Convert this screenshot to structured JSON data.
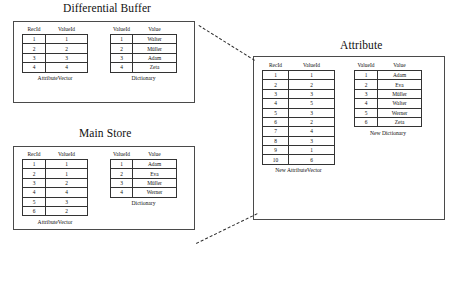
{
  "diagram": {
    "groups": [
      {
        "key": "differential_buffer",
        "title": "Differential Buffer",
        "tables": [
          {
            "key": "db_attribute_vector",
            "caption": "AttributeVector",
            "headers": [
              "RecId",
              "ValueId"
            ],
            "rows": [
              [
                "1",
                "1"
              ],
              [
                "2",
                "2"
              ],
              [
                "3",
                "3"
              ],
              [
                "4",
                "4"
              ]
            ]
          },
          {
            "key": "db_dictionary",
            "caption": "Dictionary",
            "headers": [
              "ValueId",
              "Value"
            ],
            "rows": [
              [
                "1",
                "Walter"
              ],
              [
                "2",
                "Müller"
              ],
              [
                "3",
                "Adam"
              ],
              [
                "4",
                "Zeta"
              ]
            ]
          }
        ]
      },
      {
        "key": "main_store",
        "title": "Main Store",
        "tables": [
          {
            "key": "ms_attribute_vector",
            "caption": "AttributeVector",
            "headers": [
              "RecId",
              "ValueId"
            ],
            "rows": [
              [
                "1",
                "1"
              ],
              [
                "2",
                "1"
              ],
              [
                "3",
                "2"
              ],
              [
                "4",
                "4"
              ],
              [
                "5",
                "3"
              ],
              [
                "6",
                "2"
              ]
            ]
          },
          {
            "key": "ms_dictionary",
            "caption": "Dictionary",
            "headers": [
              "ValueId",
              "Value"
            ],
            "rows": [
              [
                "1",
                "Adam"
              ],
              [
                "2",
                "Eva"
              ],
              [
                "3",
                "Müller"
              ],
              [
                "4",
                "Werner"
              ]
            ]
          }
        ]
      },
      {
        "key": "attribute",
        "title": "Attribute",
        "tables": [
          {
            "key": "new_attribute_vector",
            "caption": "New AttributeVector",
            "headers": [
              "RecId",
              "ValueId"
            ],
            "rows": [
              [
                "1",
                "1"
              ],
              [
                "2",
                "2"
              ],
              [
                "3",
                "3"
              ],
              [
                "4",
                "5"
              ],
              [
                "5",
                "3"
              ],
              [
                "6",
                "2"
              ],
              [
                "7",
                "4"
              ],
              [
                "8",
                "3"
              ],
              [
                "9",
                "1"
              ],
              [
                "10",
                "6"
              ]
            ]
          },
          {
            "key": "new_dictionary",
            "caption": "New Dictionary",
            "headers": [
              "ValueId",
              "Value"
            ],
            "rows": [
              [
                "1",
                "Adam"
              ],
              [
                "2",
                "Eva"
              ],
              [
                "3",
                "Müller"
              ],
              [
                "4",
                "Walter"
              ],
              [
                "5",
                "Werner"
              ],
              [
                "6",
                "Zeta"
              ]
            ]
          }
        ]
      }
    ],
    "connectors": [
      {
        "key": "merge-arrow-top",
        "style": "dashed"
      },
      {
        "key": "merge-arrow-bottom",
        "style": "dashed"
      }
    ],
    "colors": {
      "background": "#ffffff",
      "border": "#4a4a4a",
      "cell_border": "#333333",
      "text": "#111111",
      "connector": "#2b2b2b"
    }
  }
}
